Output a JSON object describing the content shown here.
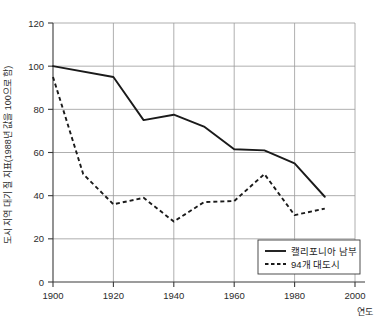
{
  "chart_data": {
    "type": "line",
    "title": "",
    "subtitle": "",
    "xlabel": "연도",
    "ylabel": "도시 지역 대기 질 지표(1988년 값을 100으로 함)",
    "xlim": [
      1900,
      2000
    ],
    "ylim": [
      0,
      120
    ],
    "grid": true,
    "xticks": [
      1900,
      1920,
      1940,
      1960,
      1980,
      2000
    ],
    "xtick_labels": [
      "1900",
      "1920",
      "1940",
      "1960",
      "1980",
      "2000"
    ],
    "yticks": [
      0,
      20,
      40,
      60,
      80,
      100,
      120
    ],
    "ytick_labels": [
      "0",
      "20",
      "40",
      "60",
      "80",
      "100",
      "120"
    ],
    "legend_position": "bottom-right",
    "series": [
      {
        "name": "캘리포니아 남부",
        "style": "solid",
        "color": "#1a1a1a",
        "x": [
          1900,
          1920,
          1930,
          1940,
          1950,
          1960,
          1970,
          1980,
          1990
        ],
        "values": [
          100,
          95,
          75,
          77.5,
          72,
          61.5,
          61,
          55,
          39.5
        ]
      },
      {
        "name": "94개 대도시",
        "style": "dashed",
        "color": "#1a1a1a",
        "x": [
          1900,
          1910,
          1920,
          1930,
          1940,
          1950,
          1960,
          1970,
          1980,
          1990
        ],
        "values": [
          95,
          50,
          36,
          39,
          28,
          37,
          37.5,
          50,
          31,
          34
        ]
      }
    ]
  },
  "legend": {
    "entries": [
      {
        "label": "캘리포니아 남부",
        "style": "solid"
      },
      {
        "label": "94개 대도시",
        "style": "dashed"
      }
    ]
  },
  "axes": {
    "x_title": "연도",
    "y_title": "도시 지역 대기 질 지표(1988년 값을 100으로 함)",
    "x_tick_labels": [
      "1900",
      "1920",
      "1940",
      "1960",
      "1980",
      "2000"
    ],
    "y_tick_labels": [
      "0",
      "20",
      "40",
      "60",
      "80",
      "100",
      "120"
    ]
  }
}
